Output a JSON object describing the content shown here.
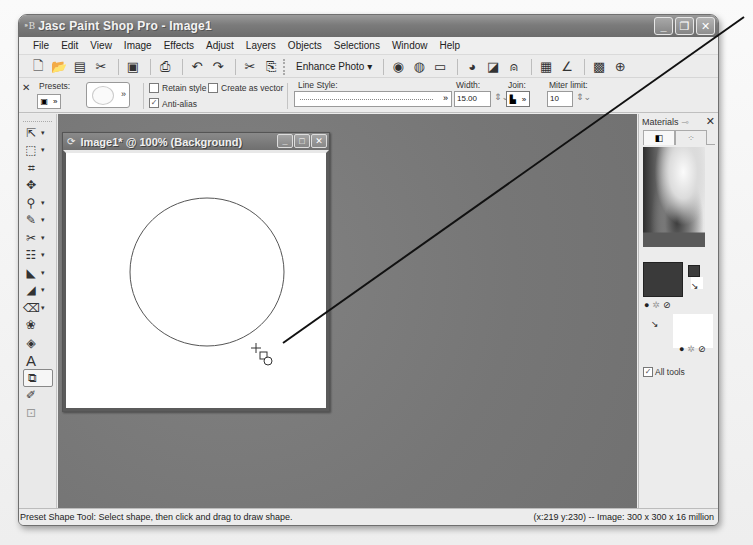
{
  "window": {
    "title": "Jasc Paint Shop Pro - Image1",
    "title_icon": "PSP",
    "controls": {
      "minimize": "_",
      "restore": "❐",
      "close": "✕"
    }
  },
  "menu": {
    "items": [
      "File",
      "Edit",
      "View",
      "Image",
      "Effects",
      "Adjust",
      "Layers",
      "Objects",
      "Selections",
      "Window",
      "Help"
    ]
  },
  "toolbar": {
    "enhance_photo_label": "Enhance Photo ▾",
    "icons": [
      "new-icon",
      "open-icon",
      "browse-icon",
      "scan-icon",
      "save-icon",
      "print-icon",
      "undo-icon",
      "redo-icon",
      "cut-icon",
      "copy-icon",
      "one-step-photo-fix-icon",
      "color-balance-icon",
      "clarify-icon",
      "fade-correction-icon",
      "contrast-icon",
      "red-eye-icon",
      "histogram-icon",
      "perspective-icon",
      "layers-icon",
      "3d-icon"
    ]
  },
  "tool_options": {
    "close": "✕",
    "presets_label": "Presets:",
    "retain_style_label": "Retain style",
    "retain_style_checked": false,
    "create_as_vector_label": "Create as vector",
    "create_as_vector_checked": false,
    "anti_alias_label": "Anti-alias",
    "anti_alias_checked": true,
    "line_style_label": "Line Style:",
    "width_label": "Width:",
    "width_value": "15.00",
    "join_label": "Join:",
    "miter_label": "Miter limit:",
    "miter_value": "10"
  },
  "tools": [
    {
      "name": "pan-tool",
      "glyph": "⇱",
      "dropdown": true
    },
    {
      "name": "selection-tool",
      "glyph": "⬚",
      "dropdown": true
    },
    {
      "name": "crop-tool",
      "glyph": "⌗",
      "dropdown": false
    },
    {
      "name": "move-tool",
      "glyph": "✥",
      "dropdown": false
    },
    {
      "name": "dropper-tool",
      "glyph": "⚲",
      "dropdown": true
    },
    {
      "name": "paint-brush-tool",
      "glyph": "✎",
      "dropdown": true
    },
    {
      "name": "clone-brush-tool",
      "glyph": "✂",
      "dropdown": true
    },
    {
      "name": "scratch-remover-tool",
      "glyph": "☷",
      "dropdown": true
    },
    {
      "name": "dodge-tool",
      "glyph": "◣",
      "dropdown": true
    },
    {
      "name": "smudge-tool",
      "glyph": "◢",
      "dropdown": true
    },
    {
      "name": "eraser-tool",
      "glyph": "⌫",
      "dropdown": true
    },
    {
      "name": "picture-tube-tool",
      "glyph": "❀",
      "dropdown": false
    },
    {
      "name": "flood-fill-tool",
      "glyph": "◈",
      "dropdown": false
    },
    {
      "name": "text-tool",
      "glyph": "A",
      "dropdown": false
    },
    {
      "name": "preset-shape-tool",
      "glyph": "⧉",
      "dropdown": false,
      "active": true
    },
    {
      "name": "pen-tool",
      "glyph": "✐",
      "dropdown": false
    },
    {
      "name": "object-selector-tool",
      "glyph": "⊡",
      "dropdown": false
    }
  ],
  "image_window": {
    "title": "Image1* @ 100% (Background)",
    "controls": {
      "minimize": "_",
      "maximize": "□",
      "close": "✕"
    }
  },
  "materials": {
    "title": "Materials",
    "close": "✕",
    "tabs": [
      "◧",
      "⁘"
    ],
    "all_tools_label": "All tools",
    "all_tools_checked": true,
    "foreground_color": "#3a3a3a",
    "background_color": "#ffffff"
  },
  "status": {
    "left": "Preset Shape Tool: Select shape, then click and drag to draw shape.",
    "right": "(x:219 y:230) -- Image:  300 x 300 x 16 million"
  },
  "colors": {
    "workspace": "#7a7a7a",
    "title_bar": "#7b7b7b",
    "chrome": "#ececec"
  }
}
